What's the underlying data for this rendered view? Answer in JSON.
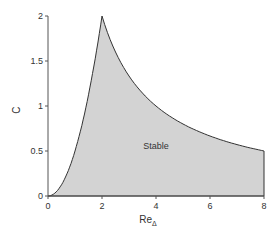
{
  "chart_data": {
    "type": "area",
    "title": "",
    "xlabel": "Re",
    "xlabel_sub": "Δ",
    "ylabel": "C",
    "xlim": [
      0,
      8
    ],
    "ylim": [
      0,
      2
    ],
    "x_ticks": [
      "0",
      "2",
      "4",
      "6",
      "8"
    ],
    "y_ticks": [
      "0",
      "0.5",
      "1",
      "1.5",
      "2"
    ],
    "grid": false,
    "legend": null,
    "annotations": [
      {
        "text": "Stable",
        "x": 4.0,
        "y": 0.52
      }
    ],
    "series": [
      {
        "name": "lower-left boundary C = Re^2/2",
        "x": [
          0,
          0.5,
          1,
          1.5,
          2
        ],
        "values": [
          0,
          0.125,
          0.5,
          1.125,
          2
        ]
      },
      {
        "name": "upper-right boundary C = 4/Re",
        "x": [
          2,
          3,
          4,
          5,
          6,
          7,
          8
        ],
        "values": [
          2,
          1.333,
          1,
          0.8,
          0.667,
          0.571,
          0.5
        ]
      }
    ],
    "region": {
      "label": "Stable",
      "fill": "#d3d3d3",
      "stroke": "#333333"
    }
  }
}
